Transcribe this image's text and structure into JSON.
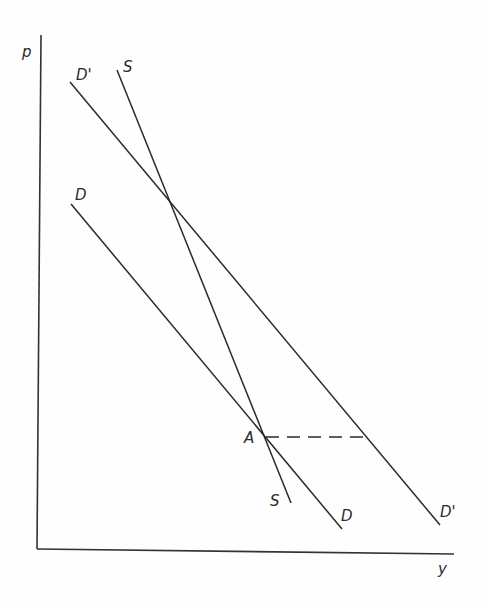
{
  "diagram": {
    "type": "supply-demand",
    "axes": {
      "y_label": "p",
      "x_label": "y"
    },
    "curves": [
      {
        "id": "D_prime",
        "label_start": "D'",
        "label_end": "D'",
        "x1": 70,
        "y1": 82,
        "x2": 440,
        "y2": 525
      },
      {
        "id": "S",
        "label_start": "S",
        "label_end": "S",
        "x1": 117,
        "y1": 70,
        "x2": 291,
        "y2": 503
      },
      {
        "id": "D",
        "label_start": "D",
        "label_end": "D",
        "x1": 71,
        "y1": 204,
        "x2": 342,
        "y2": 529
      }
    ],
    "points": [
      {
        "id": "A",
        "label": "A",
        "x": 264,
        "y": 437
      }
    ],
    "dashed_line": {
      "from": "A",
      "to": "D_prime",
      "x1": 264,
      "y1": 437,
      "x2": 367,
      "y2": 437
    }
  }
}
